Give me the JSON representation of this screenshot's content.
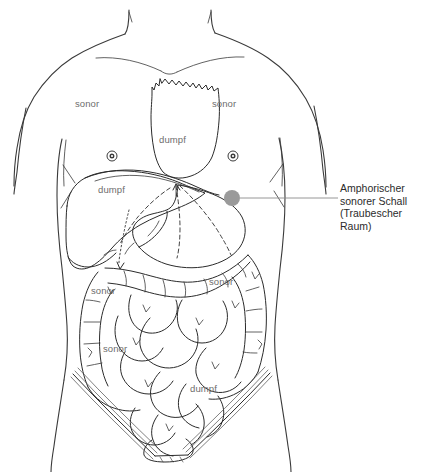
{
  "figure": {
    "background_color": "#ffffff",
    "line_color": "#2b2b2b",
    "label_color": "#6d6d6d",
    "callout_color": "#2b2b2b",
    "marker_color": "#9a9a9a",
    "leader_color": "#8a8a8a"
  },
  "percussion_labels": [
    {
      "id": "sonor-left-chest",
      "text": "sonor",
      "x": 75,
      "y": 103
    },
    {
      "id": "sonor-right-chest",
      "text": "sonor",
      "x": 212,
      "y": 103
    },
    {
      "id": "dumpf-heart",
      "text": "dumpf",
      "x": 159,
      "y": 140
    },
    {
      "id": "dumpf-liver",
      "text": "dumpf",
      "x": 98,
      "y": 189
    },
    {
      "id": "sonor-left-flank",
      "text": "sonor",
      "x": 91,
      "y": 290
    },
    {
      "id": "sonor-right-flank",
      "text": "sonor",
      "x": 209,
      "y": 281
    },
    {
      "id": "sonor-lower-left",
      "text": "sonor",
      "x": 103,
      "y": 348
    },
    {
      "id": "dumpf-bladder",
      "text": "dumpf",
      "x": 190,
      "y": 388
    }
  ],
  "callout": {
    "id": "traube-space-callout",
    "lines": [
      "Amphorischer",
      "sonorer Schall",
      "(Traubescher",
      "Raum)"
    ],
    "marker": {
      "x": 232,
      "y": 198,
      "radius": 8
    },
    "leader": {
      "x1": 240,
      "y1": 198,
      "x2": 338,
      "y2": 198
    }
  },
  "anatomy_markers": [
    {
      "id": "nipple-left",
      "x": 112,
      "y": 156,
      "outer_radius": 5,
      "inner_radius": 1.8
    },
    {
      "id": "nipple-right",
      "x": 233,
      "y": 156,
      "outer_radius": 5,
      "inner_radius": 1.8
    }
  ]
}
